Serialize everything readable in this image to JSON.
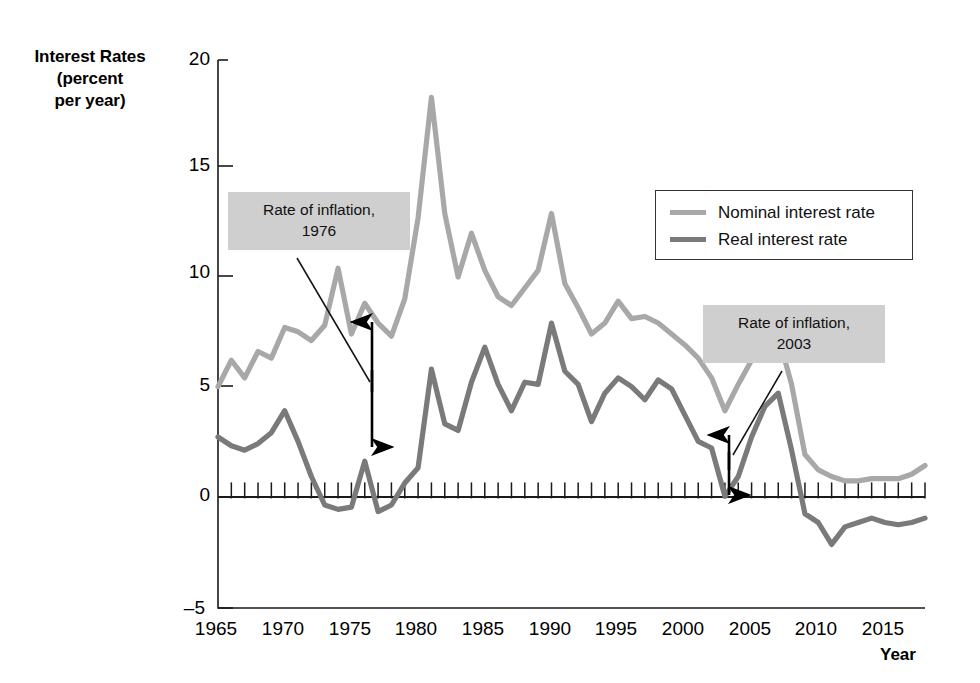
{
  "axes": {
    "ylabel_lines": [
      "Interest Rates",
      "(percent",
      "per year)"
    ],
    "xlabel": "Year",
    "yticks": [
      "20",
      "15",
      "10",
      "5",
      "0",
      "–5"
    ],
    "xticks": [
      "1965",
      "1970",
      "1975",
      "1980",
      "1985",
      "1990",
      "1995",
      "2000",
      "2005",
      "2010",
      "2015"
    ]
  },
  "legend": {
    "items": [
      {
        "label": "Nominal interest rate",
        "color": "#a8a8a8"
      },
      {
        "label": "Real interest rate",
        "color": "#7a7a7a"
      }
    ]
  },
  "annotations": [
    {
      "id": "1976",
      "line1": "Rate of inflation,",
      "line2": "1976"
    },
    {
      "id": "2003",
      "line1": "Rate of inflation,",
      "line2": "2003"
    }
  ],
  "colors": {
    "nominal": "#a8a8a8",
    "real": "#7a7a7a",
    "axis": "#1a1a1a",
    "annotation_bg": "#cfcfcf",
    "arrow": "#000000"
  },
  "chart_data": {
    "type": "line",
    "title": "",
    "xlabel": "Year",
    "ylabel": "Interest Rates (percent per year)",
    "xlim": [
      1965,
      2018
    ],
    "ylim": [
      -5,
      20
    ],
    "yticks": [
      -5,
      0,
      5,
      10,
      15,
      20
    ],
    "xticks": [
      1965,
      1970,
      1975,
      1980,
      1985,
      1990,
      1995,
      2000,
      2005,
      2010,
      2015
    ],
    "grid": false,
    "legend_position": "upper right",
    "minor_xticks": "annual ticks drawn along y=0",
    "x": [
      1965,
      1966,
      1967,
      1968,
      1969,
      1970,
      1971,
      1972,
      1973,
      1974,
      1975,
      1976,
      1977,
      1978,
      1979,
      1980,
      1981,
      1982,
      1983,
      1984,
      1985,
      1986,
      1987,
      1988,
      1989,
      1990,
      1991,
      1992,
      1993,
      1994,
      1995,
      1996,
      1997,
      1998,
      1999,
      2000,
      2001,
      2002,
      2003,
      2004,
      2005,
      2006,
      2007,
      2008,
      2009,
      2010,
      2011,
      2012,
      2013,
      2014,
      2015,
      2016,
      2017,
      2018
    ],
    "series": [
      {
        "name": "Nominal interest rate",
        "color": "#a8a8a8",
        "values": [
          5.1,
          6.3,
          5.5,
          6.7,
          6.4,
          7.8,
          7.6,
          7.2,
          7.9,
          10.5,
          7.5,
          8.9,
          8.0,
          7.4,
          9.1,
          12.8,
          18.3,
          13.0,
          10.1,
          12.1,
          10.4,
          9.2,
          8.8,
          9.6,
          10.4,
          13.0,
          9.8,
          8.7,
          7.5,
          8.0,
          9.0,
          8.2,
          8.3,
          8.0,
          7.5,
          7.0,
          6.4,
          5.5,
          4.0,
          5.2,
          6.3,
          7.1,
          7.4,
          5.2,
          2.0,
          1.3,
          1.0,
          0.8,
          0.8,
          0.9,
          0.9,
          0.9,
          1.1,
          1.5
        ]
      },
      {
        "name": "Real interest rate",
        "color": "#7a7a7a",
        "values": [
          2.8,
          2.4,
          2.2,
          2.5,
          3.0,
          4.0,
          2.6,
          1.0,
          -0.3,
          -0.5,
          -0.4,
          1.7,
          -0.6,
          -0.3,
          0.7,
          1.4,
          5.9,
          3.4,
          3.1,
          5.3,
          6.9,
          5.2,
          4.0,
          5.3,
          5.2,
          8.0,
          5.8,
          5.2,
          3.5,
          4.8,
          5.5,
          5.1,
          4.5,
          5.4,
          5.0,
          3.8,
          2.6,
          2.3,
          0.1,
          1.0,
          2.8,
          4.2,
          4.8,
          2.2,
          -0.7,
          -1.1,
          -2.1,
          -1.3,
          -1.1,
          -0.9,
          -1.1,
          -1.2,
          -1.1,
          -0.9
        ]
      }
    ],
    "annotations": [
      {
        "text": "Rate of inflation, 1976",
        "year": 1976,
        "from": 7.5,
        "to": 1.7,
        "style": "double-headed vertical arrow"
      },
      {
        "text": "Rate of inflation, 2003",
        "year": 2003,
        "from": 2.6,
        "to": 0.1,
        "style": "double-headed vertical arrow"
      }
    ]
  }
}
